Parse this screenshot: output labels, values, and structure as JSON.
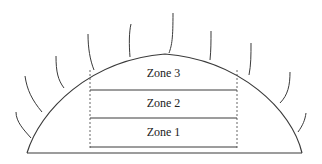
{
  "diagram": {
    "type": "cross-section",
    "colors": {
      "line": "#3a3a3a",
      "background": "#ffffff",
      "text": "#222222"
    },
    "zones": [
      {
        "label": "Zone 3"
      },
      {
        "label": "Zone 2"
      },
      {
        "label": "Zone 1"
      }
    ],
    "hair_count": 10
  }
}
